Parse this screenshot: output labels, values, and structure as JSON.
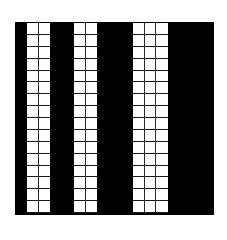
{
  "figure": {
    "background_color": "#ffffff",
    "board_color": "#000000",
    "grid_line_color": "#1a1a1a",
    "cell_color": "#ffffff",
    "rows": 16,
    "columns": [
      {
        "id": "bar-1",
        "cells_wide": 2,
        "left": 11,
        "width": 25
      },
      {
        "id": "bar-2",
        "cells_wide": 2,
        "left": 58,
        "width": 25
      },
      {
        "id": "bar-3",
        "cells_wide": 3,
        "left": 117,
        "width": 37
      }
    ]
  }
}
